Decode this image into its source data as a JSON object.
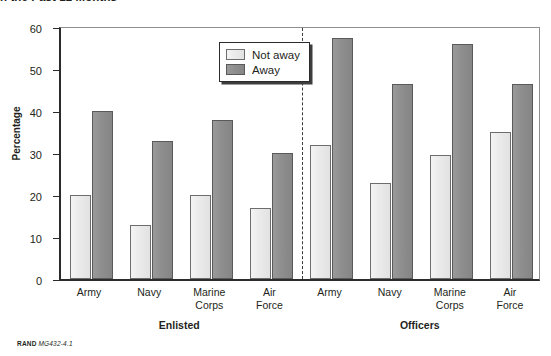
{
  "figure": {
    "title": "n the Past 12 Months",
    "footer_rand": "RAND",
    "footer_id": "MG432-4.1"
  },
  "legend": {
    "position": "top-center",
    "items": [
      {
        "label": "Not away",
        "color": "#ebebeb",
        "name": "not-away"
      },
      {
        "label": "Away",
        "color": "#8e8e8e",
        "name": "away"
      }
    ]
  },
  "axes": {
    "y_title": "Percentage",
    "y_ticks": [
      0,
      10,
      20,
      30,
      40,
      50,
      60
    ]
  },
  "groups": [
    {
      "label": "Enlisted"
    },
    {
      "label": "Officers"
    }
  ],
  "chart_data": {
    "type": "bar",
    "title": "n the Past 12 Months",
    "xlabel": "",
    "ylabel": "Percentage",
    "ylim": [
      0,
      60
    ],
    "ytick_step": 10,
    "grid": false,
    "legend_position": "top-center",
    "group_divider": true,
    "groups": [
      "Enlisted",
      "Officers"
    ],
    "categories": [
      "Army",
      "Navy",
      "Marine Corps",
      "Air Force",
      "Army",
      "Navy",
      "Marine Corps",
      "Air Force"
    ],
    "category_lines": [
      [
        "Army"
      ],
      [
        "Navy"
      ],
      [
        "Marine",
        "Corps"
      ],
      [
        "Air",
        "Force"
      ],
      [
        "Army"
      ],
      [
        "Navy"
      ],
      [
        "Marine",
        "Corps"
      ],
      [
        "Air",
        "Force"
      ]
    ],
    "category_groups": [
      "Enlisted",
      "Enlisted",
      "Enlisted",
      "Enlisted",
      "Officers",
      "Officers",
      "Officers",
      "Officers"
    ],
    "series": [
      {
        "name": "Not away",
        "color": "#ebebeb",
        "values": [
          20,
          13,
          20,
          17,
          32,
          23,
          29.5,
          35
        ]
      },
      {
        "name": "Away",
        "color": "#8e8e8e",
        "values": [
          40,
          33,
          38,
          30,
          57.5,
          46.5,
          56,
          46.5
        ]
      }
    ]
  }
}
